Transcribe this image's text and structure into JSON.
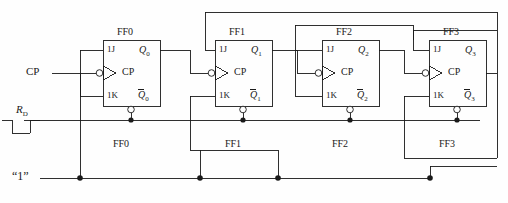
{
  "diagram": {
    "line_color": "#1a1a1a",
    "background_color": "#fefefe"
  },
  "inputs": {
    "clock_label": "CP",
    "reset_label": "R",
    "reset_sub": "D",
    "logic_one_label": "“1”"
  },
  "flipflops": [
    {
      "id": "ff0",
      "title": "FF0",
      "bottom_label": "FF0",
      "pin_j": "1J",
      "pin_k": "1K",
      "pin_clk": "CP",
      "out_q": "Q",
      "out_q_sub": "0",
      "out_qbar": "Q",
      "out_qbar_sub": "0"
    },
    {
      "id": "ff1",
      "title": "FF1",
      "bottom_label": "FF1",
      "pin_j": "1J",
      "pin_k": "1K",
      "pin_clk": "CP",
      "out_q": "Q",
      "out_q_sub": "1",
      "out_qbar": "Q",
      "out_qbar_sub": "1"
    },
    {
      "id": "ff2",
      "title": "FF2",
      "bottom_label": "FF2",
      "pin_j": "1J",
      "pin_k": "1K",
      "pin_clk": "CP",
      "out_q": "Q",
      "out_q_sub": "2",
      "out_qbar": "Q",
      "out_qbar_sub": "2"
    },
    {
      "id": "ff3",
      "title": "FF3",
      "bottom_label": "FF3",
      "pin_j": "1J",
      "pin_k": "1K",
      "pin_clk": "CP",
      "out_q": "Q",
      "out_q_sub": "3",
      "out_qbar": "Q",
      "out_qbar_sub": "3"
    }
  ]
}
